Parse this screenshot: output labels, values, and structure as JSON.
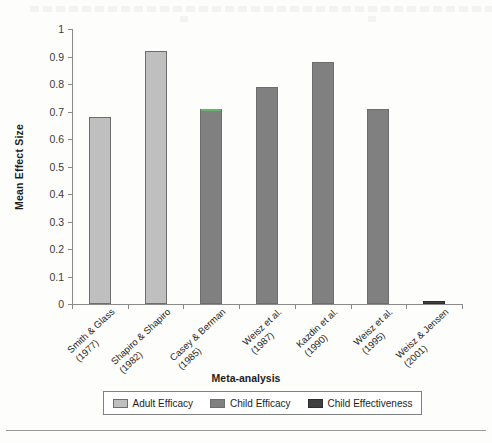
{
  "chart_data": {
    "type": "bar",
    "title": "",
    "xlabel": "Meta-analysis",
    "ylabel": "Mean Effect Size",
    "ylim": [
      0,
      1
    ],
    "ytick_values": [
      0,
      0.1,
      0.2,
      0.3,
      0.4,
      0.5,
      0.6,
      0.7,
      0.8,
      0.9,
      1
    ],
    "ytick_labels": [
      "0",
      "0.1",
      "0.2",
      "0.3",
      "0.4",
      "0.5",
      "0.6",
      "0.7",
      "0.8",
      "0.9",
      "1"
    ],
    "grid": false,
    "legend_position": "bottom",
    "categories": [
      "Smith & Glass (1977)",
      "Shapiro & Shapiro (1982)",
      "Casey & Berman (1985)",
      "Weisz et al. (1987)",
      "Kazdin et al. (1990)",
      "Weisz et al. (1995)",
      "Weisz & Jensen (2001)"
    ],
    "category_lines": [
      [
        "Smith & Glass",
        "(1977)"
      ],
      [
        "Shapiro & Shapiro",
        "(1982)"
      ],
      [
        "Casey & Berman",
        "(1985)"
      ],
      [
        "Weisz et al.",
        "(1987)"
      ],
      [
        "Kazdin et al.",
        "(1990)"
      ],
      [
        "Weisz et al.",
        "(1995)"
      ],
      [
        "Weisz & Jensen",
        "(2001)"
      ]
    ],
    "values": [
      0.68,
      0.92,
      0.71,
      0.79,
      0.88,
      0.71,
      0.01
    ],
    "series_of_bar": [
      0,
      0,
      1,
      1,
      1,
      1,
      2
    ],
    "series": [
      {
        "name": "Adult Efficacy",
        "color": "#bfbfbf"
      },
      {
        "name": "Child Efficacy",
        "color": "#808080"
      },
      {
        "name": "Child Effectiveness",
        "color": "#404040"
      }
    ]
  },
  "legend": {
    "items": [
      {
        "label": "Adult Efficacy"
      },
      {
        "label": "Child Efficacy"
      },
      {
        "label": "Child Effectiveness"
      }
    ]
  }
}
